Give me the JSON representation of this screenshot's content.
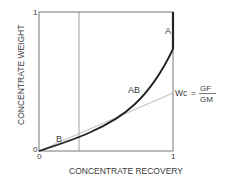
{
  "diagram": {
    "type": "recovery-weight curve",
    "x_axis": {
      "label": "CONCENTRATE RECOVERY",
      "min_label": "0",
      "max_label": "1"
    },
    "y_axis": {
      "label": "CONCENTRATE WEIGHT",
      "min_label": "0",
      "max_label": "1"
    },
    "points": {
      "A": "A",
      "AB": "AB",
      "B": "B"
    },
    "formula": {
      "lhs": "Wc",
      "equals": "=",
      "numerator": "GF",
      "denominator": "GM"
    },
    "colors": {
      "frame": "#777777",
      "curve": "#222222",
      "guide": "#999999"
    }
  }
}
